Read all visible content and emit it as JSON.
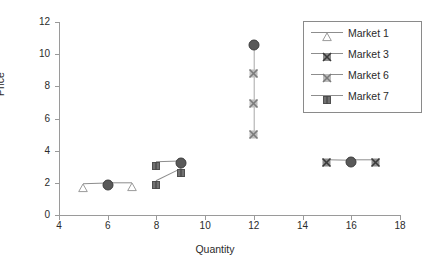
{
  "chart_data": {
    "type": "scatter",
    "title": "",
    "xlabel": "Quantity",
    "ylabel": "Price",
    "xlim": [
      4,
      18
    ],
    "ylim": [
      0,
      12
    ],
    "xticks": [
      4,
      6,
      8,
      10,
      12,
      14,
      16,
      18
    ],
    "yticks": [
      0,
      2,
      4,
      6,
      8,
      10,
      12
    ],
    "grid": false,
    "legend_position": "top-right",
    "series": [
      {
        "name": "Market 1",
        "marker": "triangle-open",
        "color": "#8d8d8d",
        "points": [
          {
            "x": 5,
            "y": 1.95,
            "marker": "triangle-open"
          },
          {
            "x": 6,
            "y": 2.0,
            "marker": "circle-filled"
          },
          {
            "x": 7,
            "y": 2.0,
            "marker": "triangle-open"
          }
        ]
      },
      {
        "name": "Market 3",
        "marker": "x-dark",
        "color": "#8d8d8d",
        "points": [
          {
            "x": 15,
            "y": 3.45,
            "marker": "x-dark"
          },
          {
            "x": 16,
            "y": 3.42,
            "marker": "circle-filled"
          },
          {
            "x": 17,
            "y": 3.42,
            "marker": "x-dark"
          }
        ]
      },
      {
        "name": "Market 6",
        "marker": "x-light",
        "color": "#a8a8a8",
        "points": [
          {
            "x": 12,
            "y": 10.7,
            "marker": "circle-filled"
          },
          {
            "x": 12,
            "y": 9.0,
            "marker": "x-light"
          },
          {
            "x": 12,
            "y": 7.1,
            "marker": "x-light"
          },
          {
            "x": 12,
            "y": 5.2,
            "marker": "x-light"
          }
        ]
      },
      {
        "name": "Market 7",
        "marker": "square",
        "color": "#8d8d8d",
        "points": [
          {
            "x": 8,
            "y": 3.3,
            "marker": "square"
          },
          {
            "x": 9,
            "y": 3.35,
            "marker": "circle-filled"
          },
          {
            "x": 8,
            "y": 2.1,
            "marker": "square"
          },
          {
            "x": 9,
            "y": 2.85,
            "marker": "square"
          }
        ]
      }
    ],
    "legend": [
      {
        "label": "Market 1",
        "marker": "triangle-open"
      },
      {
        "label": "Market 3",
        "marker": "x-dark"
      },
      {
        "label": "Market 6",
        "marker": "x-light"
      },
      {
        "label": "Market 7",
        "marker": "square"
      }
    ]
  },
  "axes": {
    "ylabel": "Price",
    "xlabel": "Quantity",
    "ytick_labels": [
      "0",
      "2",
      "4",
      "6",
      "8",
      "10",
      "12"
    ],
    "xtick_labels": [
      "4",
      "6",
      "8",
      "10",
      "12",
      "14",
      "16",
      "18"
    ]
  },
  "legend": {
    "items": [
      {
        "label": "Market 1"
      },
      {
        "label": "Market 3"
      },
      {
        "label": "Market 6"
      },
      {
        "label": "Market 7"
      }
    ]
  },
  "colors": {
    "axis": "#9a9a9a",
    "line": "#8d8d8d",
    "marker_dark": "#595959",
    "marker_light": "#a8a8a8",
    "text": "#2b2b2b",
    "background": "#ffffff"
  }
}
